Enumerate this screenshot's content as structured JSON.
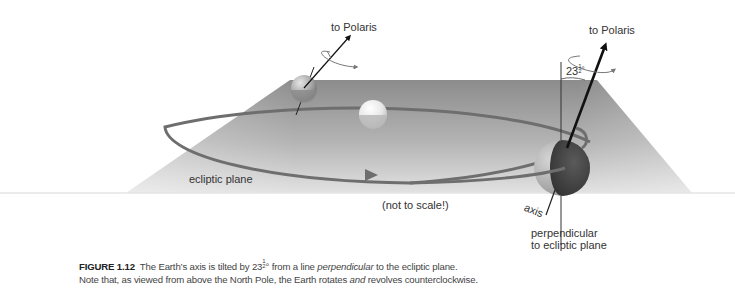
{
  "diagram": {
    "labels": {
      "polaris_small": "to Polaris",
      "polaris_large": "to Polaris",
      "tilt_angle_whole": "23",
      "tilt_angle_num": "1",
      "tilt_angle_den": "2",
      "tilt_angle_unit": "°",
      "ecliptic_plane": "ecliptic plane",
      "not_to_scale": "(not to scale!)",
      "axis": "axis",
      "perpendicular_line1": "perpendicular",
      "perpendicular_line2": "to ecliptic plane"
    },
    "objects": [
      "ecliptic-plane",
      "orbit-ellipse",
      "sun",
      "earth-far",
      "earth-near",
      "axis-arrow",
      "perpendicular-line",
      "rotation-arrows"
    ],
    "colors": {
      "plane_light": "#dcdcdc",
      "plane_dark": "#8e8e8e",
      "orbit": "#6f6f6f",
      "arrow": "#111111",
      "earth_dark": "#4a4a4a",
      "sun": "#f2f2f2"
    }
  },
  "caption": {
    "figure_label": "FIGURE 1.12",
    "line1_a": "The Earth’s axis is tilted by 23",
    "line1_frac_num": "1",
    "line1_frac_den": "2",
    "line1_b": "° from a line ",
    "line1_italic": "perpendicular",
    "line1_c": " to the ecliptic plane.",
    "line2_a": "Note that, as viewed from above the North Pole, the Earth rotates ",
    "line2_italic": "and",
    "line2_b": " revolves counterclockwise."
  }
}
